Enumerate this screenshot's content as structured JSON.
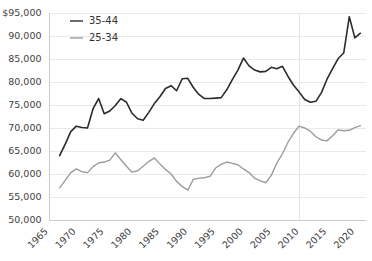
{
  "chart_data": {
    "type": "line",
    "title": "",
    "subtitle": "",
    "xlabel": "",
    "ylabel": "",
    "xlim": [
      1965,
      2022
    ],
    "ylim": [
      50000,
      95000
    ],
    "grid": true,
    "legend_position": "top-left",
    "y_ticks": [
      50000,
      55000,
      60000,
      65000,
      70000,
      75000,
      80000,
      85000,
      90000,
      95000
    ],
    "y_tick_labels": [
      "50,000",
      "55,000",
      "60,000",
      "65,000",
      "70,000",
      "75,000",
      "80,000",
      "85,000",
      "90,000",
      "$95,000"
    ],
    "x_ticks": [
      1965,
      1970,
      1975,
      1980,
      1985,
      1990,
      1995,
      2000,
      2005,
      2010,
      2015,
      2020
    ],
    "x_tick_labels": [
      "1965",
      "1970",
      "1975",
      "1980",
      "1985",
      "1990",
      "1995",
      "2000",
      "2005",
      "2010",
      "2015",
      "2020"
    ],
    "series": [
      {
        "name": "35-44",
        "color": "#2b2b2b",
        "width": 1.6,
        "x": [
          1967,
          1968,
          1969,
          1970,
          1971,
          1972,
          1973,
          1974,
          1975,
          1976,
          1977,
          1978,
          1979,
          1980,
          1981,
          1982,
          1983,
          1984,
          1985,
          1986,
          1987,
          1988,
          1989,
          1990,
          1991,
          1992,
          1993,
          1994,
          1995,
          1996,
          1997,
          1998,
          1999,
          2000,
          2001,
          2002,
          2003,
          2004,
          2005,
          2006,
          2007,
          2008,
          2009,
          2010,
          2011,
          2012,
          2013,
          2014,
          2015,
          2016,
          2017,
          2018,
          2019,
          2020,
          2021
        ],
        "values": [
          64000,
          66500,
          69200,
          70400,
          70100,
          70000,
          74200,
          76400,
          73100,
          73700,
          74900,
          76400,
          75600,
          73200,
          72000,
          71700,
          73400,
          75300,
          76800,
          78600,
          79200,
          78100,
          80700,
          80800,
          78800,
          77300,
          76400,
          76400,
          76500,
          76600,
          78300,
          80500,
          82600,
          85200,
          83500,
          82600,
          82200,
          82300,
          83200,
          82900,
          83400,
          81200,
          79300,
          77800,
          76200,
          75600,
          75800,
          77700,
          80600,
          82900,
          85100,
          86300,
          94200,
          89600,
          90600
        ]
      },
      {
        "name": "25-34",
        "color": "#9b9b9b",
        "width": 1.4,
        "x": [
          1967,
          1968,
          1969,
          1970,
          1971,
          1972,
          1973,
          1974,
          1975,
          1976,
          1977,
          1978,
          1979,
          1980,
          1981,
          1982,
          1983,
          1984,
          1985,
          1986,
          1987,
          1988,
          1989,
          1990,
          1991,
          1992,
          1993,
          1994,
          1995,
          1996,
          1997,
          1998,
          1999,
          2000,
          2001,
          2002,
          2003,
          2004,
          2005,
          2006,
          2007,
          2008,
          2009,
          2010,
          2011,
          2012,
          2013,
          2014,
          2015,
          2016,
          2017,
          2018,
          2019,
          2020,
          2021
        ],
        "values": [
          57000,
          58600,
          60300,
          61100,
          60500,
          60300,
          61600,
          62400,
          62600,
          63000,
          64600,
          63100,
          61700,
          60400,
          60700,
          61700,
          62700,
          63500,
          62200,
          61000,
          60000,
          58400,
          57300,
          56500,
          58800,
          59100,
          59200,
          59500,
          61300,
          62100,
          62600,
          62300,
          62000,
          61100,
          60300,
          59100,
          58500,
          58100,
          59700,
          62400,
          64400,
          66900,
          68900,
          70400,
          70000,
          69300,
          68100,
          67400,
          67200,
          68300,
          69600,
          69400,
          69500,
          70100,
          70500
        ]
      }
    ],
    "legend": [
      {
        "label": "35-44",
        "color": "#2b2b2b"
      },
      {
        "label": "25-34",
        "color": "#9b9b9b"
      }
    ]
  }
}
